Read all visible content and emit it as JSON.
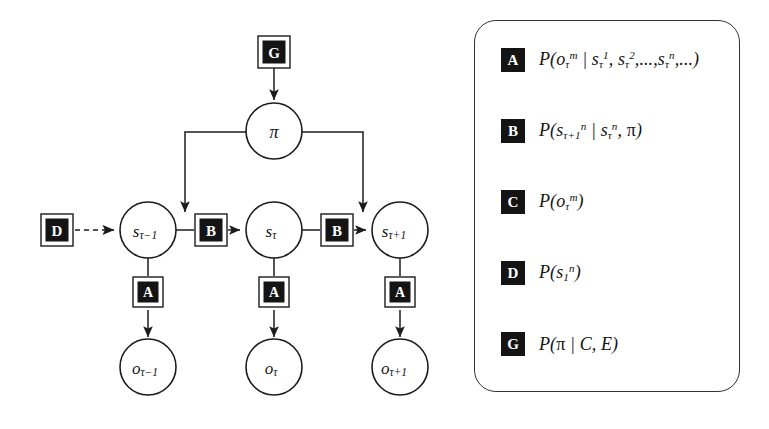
{
  "figure": {
    "kind": "factor-graph"
  },
  "graph": {
    "nodes": [
      {
        "id": "G",
        "type": "factor-box",
        "label": "G",
        "cx": 274,
        "cy": 52
      },
      {
        "id": "pi",
        "type": "circle",
        "label": "π",
        "cx": 274,
        "cy": 131
      },
      {
        "id": "D",
        "type": "factor-box",
        "label": "D",
        "cx": 57,
        "cy": 230
      },
      {
        "id": "s_prev",
        "type": "circle",
        "base": "s",
        "subscript": "τ−1",
        "cx": 148,
        "cy": 230
      },
      {
        "id": "B_left",
        "type": "factor-box",
        "label": "B",
        "cx": 211,
        "cy": 230
      },
      {
        "id": "s_curr",
        "type": "circle",
        "base": "s",
        "subscript": "τ",
        "cx": 274,
        "cy": 230
      },
      {
        "id": "B_right",
        "type": "factor-box",
        "label": "B",
        "cx": 337,
        "cy": 230
      },
      {
        "id": "s_next",
        "type": "circle",
        "base": "s",
        "subscript": "τ+1",
        "cx": 400,
        "cy": 230
      },
      {
        "id": "A_left",
        "type": "factor-box",
        "label": "A",
        "cx": 148,
        "cy": 293
      },
      {
        "id": "A_mid",
        "type": "factor-box",
        "label": "A",
        "cx": 274,
        "cy": 293
      },
      {
        "id": "A_right",
        "type": "factor-box",
        "label": "A",
        "cx": 400,
        "cy": 293
      },
      {
        "id": "o_prev",
        "type": "circle",
        "base": "o",
        "subscript": "τ−1",
        "cx": 148,
        "cy": 367
      },
      {
        "id": "o_curr",
        "type": "circle",
        "base": "o",
        "subscript": "τ",
        "cx": 274,
        "cy": 367
      },
      {
        "id": "o_next",
        "type": "circle",
        "base": "o",
        "subscript": "τ+1",
        "cx": 400,
        "cy": 367
      }
    ],
    "edges": [
      {
        "from": "G",
        "to": "pi",
        "style": "solid",
        "arrow": true
      },
      {
        "from": "pi",
        "to": "B_left",
        "style": "solid",
        "arrow": true,
        "routing": "elbow-left"
      },
      {
        "from": "pi",
        "to": "B_right",
        "style": "solid",
        "arrow": true,
        "routing": "elbow-right"
      },
      {
        "from": "D",
        "to": "s_prev",
        "style": "dashed",
        "arrow": true
      },
      {
        "from": "s_prev",
        "to": "B_left",
        "style": "solid",
        "arrow": false
      },
      {
        "from": "B_left",
        "to": "s_curr",
        "style": "solid",
        "arrow": true
      },
      {
        "from": "s_curr",
        "to": "B_right",
        "style": "solid",
        "arrow": false
      },
      {
        "from": "B_right",
        "to": "s_next",
        "style": "solid",
        "arrow": true
      },
      {
        "from": "s_prev",
        "to": "A_left",
        "style": "solid",
        "arrow": false
      },
      {
        "from": "A_left",
        "to": "o_prev",
        "style": "solid",
        "arrow": true
      },
      {
        "from": "s_curr",
        "to": "A_mid",
        "style": "solid",
        "arrow": false
      },
      {
        "from": "A_mid",
        "to": "o_curr",
        "style": "solid",
        "arrow": true
      },
      {
        "from": "s_next",
        "to": "A_right",
        "style": "solid",
        "arrow": false
      },
      {
        "from": "A_right",
        "to": "o_next",
        "style": "solid",
        "arrow": true
      }
    ]
  },
  "legend": {
    "entries": [
      {
        "key": "A",
        "formula_plain": "P(oτ^m | sτ^1, sτ^2,...,sτ^n,...)",
        "formula_html": "P(<i>o</i><sub>τ</sub><sup>m</sup> | <i>s</i><sub>τ</sub><sup>1</sup>, <i>s</i><sub>τ</sub><sup>2</sup>,...,<i>s</i><sub>τ</sub><sup>n</sup>,...)"
      },
      {
        "key": "B",
        "formula_plain": "P(sτ+1^n | sτ^n, π)",
        "formula_html": "P(<i>s</i><sub>τ+1</sub><sup>n</sup> | <i>s</i><sub>τ</sub><sup>n</sup>, <span class=\"upr\">π</span>)"
      },
      {
        "key": "C",
        "formula_plain": "P(oτ^m)",
        "formula_html": "P(<i>o</i><sub>τ</sub><sup>m</sup>)"
      },
      {
        "key": "D",
        "formula_plain": "P(s1^n)",
        "formula_html": "P(<i>s</i><sub>1</sub><sup>n</sup>)"
      },
      {
        "key": "G",
        "formula_plain": "P(π | C, E)",
        "formula_html": "P(<span class=\"upr\">π</span> | <i>C</i>, <i>E</i>)"
      }
    ]
  },
  "colors": {
    "ink": "#141414",
    "stroke": "#1c1c1c",
    "panel_border": "#333333",
    "background": "#ffffff",
    "box_fill": "#141414",
    "box_letter": "#ffffff"
  }
}
